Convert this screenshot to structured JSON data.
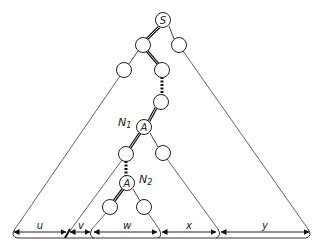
{
  "diagram": {
    "type": "tree-with-subtree-widths",
    "nodes": [
      {
        "id": "S",
        "label": "S",
        "x": 163,
        "y": 20
      },
      {
        "id": "s_l",
        "label": "",
        "x": 143,
        "y": 45
      },
      {
        "id": "s_r",
        "label": "",
        "x": 179,
        "y": 45
      },
      {
        "id": "sl_l",
        "label": "",
        "x": 124,
        "y": 70
      },
      {
        "id": "sl_r",
        "label": "",
        "x": 162,
        "y": 70
      },
      {
        "id": "mid",
        "label": "",
        "x": 161,
        "y": 102
      },
      {
        "id": "A1",
        "label": "A",
        "x": 144,
        "y": 127
      },
      {
        "id": "a1_l",
        "label": "",
        "x": 126,
        "y": 154
      },
      {
        "id": "a1_r",
        "label": "",
        "x": 163,
        "y": 153
      },
      {
        "id": "A2",
        "label": "A",
        "x": 127,
        "y": 183
      },
      {
        "id": "a2_l",
        "label": "",
        "x": 110,
        "y": 207
      },
      {
        "id": "a2_r",
        "label": "",
        "x": 144,
        "y": 207
      }
    ],
    "annotations": {
      "n1": {
        "label": "N",
        "sub": "1"
      },
      "n2": {
        "label": "N",
        "sub": "2"
      }
    },
    "widths": [
      {
        "label": "u",
        "from": 13,
        "to": 68
      },
      {
        "label": "v",
        "from": 68,
        "to": 92
      },
      {
        "label": "w",
        "from": 92,
        "to": 160
      },
      {
        "label": "x",
        "from": 160,
        "to": 219
      },
      {
        "label": "y",
        "from": 219,
        "to": 310
      }
    ],
    "colors": {
      "line": "#333333",
      "thin": "#555555"
    }
  }
}
